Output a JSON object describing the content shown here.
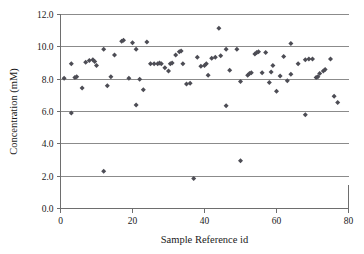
{
  "chart_data": {
    "type": "scatter",
    "title": "",
    "xlabel": "Sample Reference id",
    "ylabel": "Concentration (mM)",
    "xlim": [
      0,
      80
    ],
    "ylim": [
      0,
      12
    ],
    "xticks": [
      "0",
      "20",
      "40",
      "60",
      "80"
    ],
    "xtick_values": [
      0,
      20,
      40,
      60,
      80
    ],
    "yticks": [
      "0.0",
      "2.0",
      "4.0",
      "6.0",
      "8.0",
      "10.0",
      "12.0"
    ],
    "ytick_values": [
      0,
      2,
      4,
      6,
      8,
      10,
      12
    ],
    "grid": "horizontal",
    "legend": "none",
    "marker": "diamond",
    "marker_color": "#4d4d55",
    "series": [
      {
        "name": "Concentration",
        "points": [
          [
            1,
            8.05
          ],
          [
            3,
            8.95
          ],
          [
            4,
            8.1
          ],
          [
            4.5,
            8.15
          ],
          [
            3,
            5.9
          ],
          [
            6,
            7.45
          ],
          [
            7,
            9.05
          ],
          [
            8,
            9.15
          ],
          [
            9,
            9.2
          ],
          [
            9.5,
            9.1
          ],
          [
            10,
            8.85
          ],
          [
            12,
            2.3
          ],
          [
            12,
            9.85
          ],
          [
            13,
            7.6
          ],
          [
            14,
            8.15
          ],
          [
            15,
            9.5
          ],
          [
            17,
            10.35
          ],
          [
            17.5,
            10.4
          ],
          [
            19,
            8.05
          ],
          [
            20,
            10.25
          ],
          [
            21,
            9.85
          ],
          [
            21,
            6.4
          ],
          [
            22,
            8.0
          ],
          [
            23,
            7.35
          ],
          [
            24,
            10.3
          ],
          [
            25,
            8.95
          ],
          [
            26,
            8.95
          ],
          [
            27,
            8.95
          ],
          [
            27.5,
            9.0
          ],
          [
            28,
            8.95
          ],
          [
            29,
            8.7
          ],
          [
            30,
            8.5
          ],
          [
            30.5,
            8.95
          ],
          [
            31,
            9.0
          ],
          [
            32,
            9.5
          ],
          [
            33,
            9.7
          ],
          [
            33.5,
            9.75
          ],
          [
            34,
            8.95
          ],
          [
            35,
            7.7
          ],
          [
            36,
            7.75
          ],
          [
            37,
            1.85
          ],
          [
            38,
            9.35
          ],
          [
            39,
            8.8
          ],
          [
            40,
            8.85
          ],
          [
            40.5,
            8.95
          ],
          [
            41,
            8.25
          ],
          [
            42,
            9.3
          ],
          [
            43,
            9.35
          ],
          [
            44,
            11.15
          ],
          [
            44.5,
            9.45
          ],
          [
            46,
            6.35
          ],
          [
            46,
            9.85
          ],
          [
            47,
            8.55
          ],
          [
            49,
            9.85
          ],
          [
            50,
            2.95
          ],
          [
            50,
            7.85
          ],
          [
            52,
            8.25
          ],
          [
            52.5,
            8.35
          ],
          [
            53,
            8.4
          ],
          [
            54,
            9.55
          ],
          [
            54.5,
            9.65
          ],
          [
            55,
            9.7
          ],
          [
            56,
            8.4
          ],
          [
            57,
            9.65
          ],
          [
            58,
            7.8
          ],
          [
            58.5,
            8.45
          ],
          [
            59,
            8.85
          ],
          [
            60,
            7.25
          ],
          [
            61,
            8.2
          ],
          [
            62,
            9.4
          ],
          [
            63,
            7.9
          ],
          [
            64,
            10.2
          ],
          [
            64,
            8.3
          ],
          [
            66,
            8.95
          ],
          [
            68,
            5.8
          ],
          [
            68,
            9.2
          ],
          [
            69,
            9.25
          ],
          [
            70,
            9.25
          ],
          [
            71,
            8.1
          ],
          [
            71.5,
            8.15
          ],
          [
            72,
            8.35
          ],
          [
            73,
            8.5
          ],
          [
            73.5,
            8.6
          ],
          [
            75,
            9.25
          ],
          [
            76,
            6.95
          ],
          [
            77,
            6.55
          ]
        ]
      }
    ]
  }
}
